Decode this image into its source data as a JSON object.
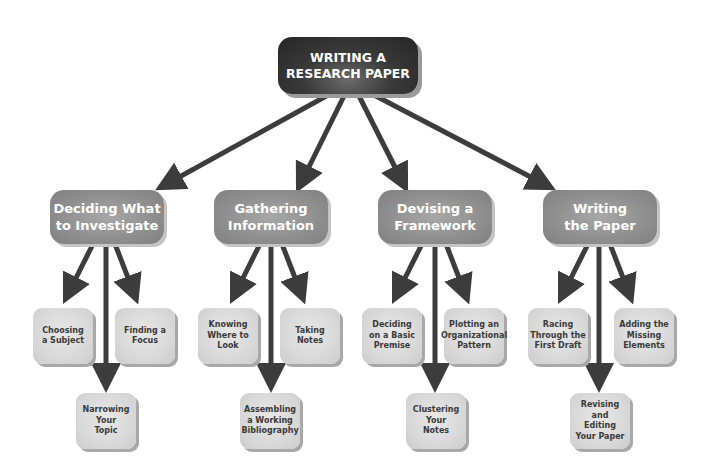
{
  "diagram": {
    "root": {
      "label": "WRITING A\nRESEARCH PAPER"
    },
    "branches": [
      {
        "label": "Deciding What\nto Investigate",
        "children": [
          {
            "label": "Choosing\na Subject",
            "position": "left"
          },
          {
            "label": "Finding a\nFocus",
            "position": "right"
          },
          {
            "label": "Narrowing\nYour\nTopic",
            "position": "bottom"
          }
        ]
      },
      {
        "label": "Gathering\nInformation",
        "children": [
          {
            "label": "Knowing\nWhere to\nLook",
            "position": "left"
          },
          {
            "label": "Taking\nNotes",
            "position": "right"
          },
          {
            "label": "Assembling\na Working\nBibliography",
            "position": "bottom"
          }
        ]
      },
      {
        "label": "Devising a\nFramework",
        "children": [
          {
            "label": "Deciding\non a Basic\nPremise",
            "position": "left"
          },
          {
            "label": "Plotting an\nOrganizational\nPattern",
            "position": "right"
          },
          {
            "label": "Clustering\nYour\nNotes",
            "position": "bottom"
          }
        ]
      },
      {
        "label": "Writing\nthe Paper",
        "children": [
          {
            "label": "Racing\nThrough the\nFirst Draft",
            "position": "left"
          },
          {
            "label": "Adding the\nMissing\nElements",
            "position": "right"
          },
          {
            "label": "Revising and\nEditing\nYour Paper",
            "position": "bottom"
          }
        ]
      }
    ],
    "colors": {
      "root_fill": "#2e2e2e",
      "branch_fill": "#8e8e8e",
      "leaf_fill": "#d6d6d6",
      "arrow": "#3c3c3c"
    }
  }
}
